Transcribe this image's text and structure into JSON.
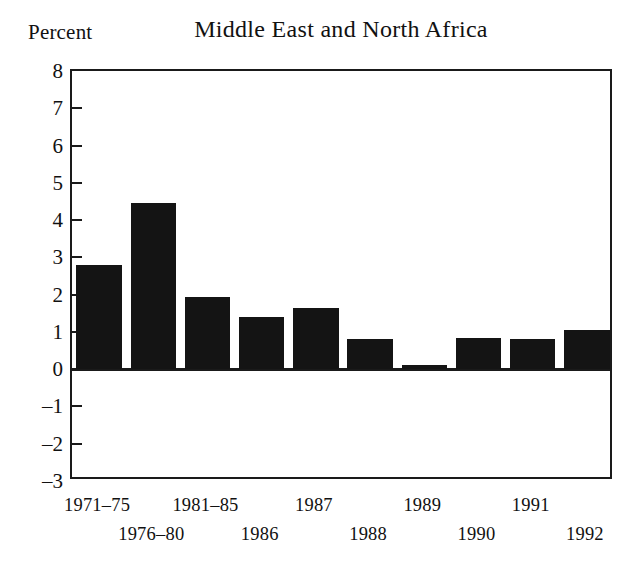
{
  "chart_data": {
    "type": "bar",
    "title": "Middle East and North Africa",
    "xlabel": "",
    "ylabel": "Percent",
    "ylim": [
      -3,
      8
    ],
    "ytick_values": [
      8,
      7,
      6,
      5,
      4,
      3,
      2,
      1,
      0,
      -1,
      -2,
      -3
    ],
    "ytick_labels": [
      "8",
      "7",
      "6",
      "5",
      "4",
      "3",
      "2",
      "1",
      "0",
      "–1",
      "–2",
      "–3"
    ],
    "grid": false,
    "legend": null,
    "bar_color": "#141414",
    "axis_color": "#1a1a1a",
    "background": "#ffffff",
    "categories": [
      "1971–75",
      "1976–80",
      "1981–85",
      "1986",
      "1987",
      "1988",
      "1989",
      "1990",
      "1991",
      "1992"
    ],
    "category_label_rows": [
      0,
      1,
      0,
      1,
      0,
      1,
      0,
      1,
      0,
      1
    ],
    "values": [
      2.8,
      4.45,
      1.95,
      1.4,
      1.65,
      0.8,
      0.1,
      0.85,
      0.8,
      1.05
    ]
  }
}
